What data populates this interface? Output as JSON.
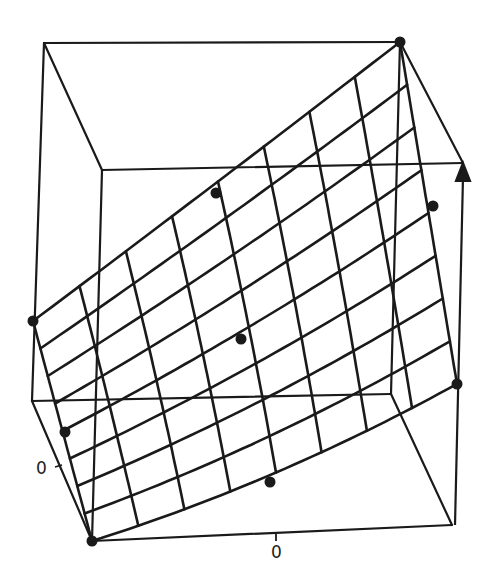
{
  "figure": {
    "type": "3d-surface-plot",
    "axis_labels": {
      "left_tick": "0",
      "bottom_tick": "0"
    },
    "colors": {
      "ink": "#1a1a1a",
      "background": "#ffffff"
    },
    "box": {
      "outer_top_left": [
        44,
        43
      ],
      "outer_top_right": [
        400,
        42
      ],
      "outer_bottom_left": [
        32,
        401
      ],
      "outer_bottom_right": [
        391,
        394
      ],
      "inner_top_left": [
        102,
        170
      ],
      "inner_top_right": [
        463,
        163
      ],
      "inner_bottom_left": [
        92,
        541
      ],
      "inner_bottom_right": [
        452,
        525
      ]
    },
    "surface": {
      "corners": {
        "p00": [
          92,
          541
        ],
        "p10": [
          457,
          384
        ],
        "p01": [
          33,
          321
        ],
        "p11": [
          400,
          42
        ]
      },
      "grid_u_lines": 9,
      "grid_v_lines": 9,
      "bulge": [
        6,
        10
      ]
    },
    "control_points": [
      {
        "name": "corner-top-right",
        "xy": [
          400,
          42
        ]
      },
      {
        "name": "corner-left",
        "xy": [
          33,
          321
        ]
      },
      {
        "name": "corner-right",
        "xy": [
          457,
          384
        ]
      },
      {
        "name": "corner-bottom",
        "xy": [
          92,
          541
        ]
      },
      {
        "name": "edge-mid-top",
        "xy": [
          216,
          193
        ]
      },
      {
        "name": "edge-mid-right",
        "xy": [
          433,
          206
        ]
      },
      {
        "name": "edge-mid-left",
        "xy": [
          65,
          432
        ]
      },
      {
        "name": "edge-mid-bottom",
        "xy": [
          270,
          482
        ]
      },
      {
        "name": "center",
        "xy": [
          241,
          339
        ]
      }
    ],
    "arrow": {
      "from": [
        455,
        525
      ],
      "to": [
        463,
        163
      ]
    },
    "ticks": {
      "left": {
        "from": [
          55,
          467
        ],
        "to": [
          62,
          465
        ],
        "label_xy": [
          36,
          458
        ]
      },
      "bottom": {
        "from": [
          276,
          534
        ],
        "to": [
          276,
          541
        ],
        "label_xy": [
          271,
          542
        ]
      }
    }
  }
}
